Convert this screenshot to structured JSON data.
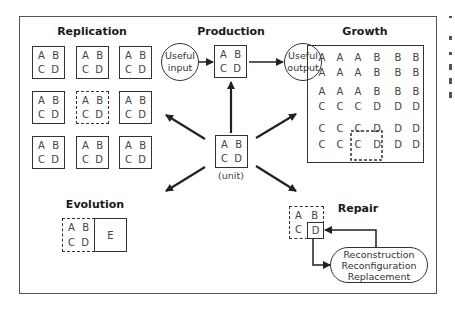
{
  "sections": {
    "replication": {
      "title": "Replication",
      "units": [
        {
          "a": "A",
          "b": "B",
          "c": "C",
          "d": "D",
          "style": "solid"
        },
        {
          "a": "A",
          "b": "B",
          "c": "C",
          "d": "D",
          "style": "solid"
        },
        {
          "a": "A",
          "b": "B",
          "c": "C",
          "d": "D",
          "style": "solid"
        },
        {
          "a": "A",
          "b": "B",
          "c": "C",
          "d": "D",
          "style": "solid"
        },
        {
          "a": "A",
          "b": "B",
          "c": "C",
          "d": "D",
          "style": "dashed"
        },
        {
          "a": "A",
          "b": "B",
          "c": "C",
          "d": "D",
          "style": "solid"
        },
        {
          "a": "A",
          "b": "B",
          "c": "C",
          "d": "D",
          "style": "solid"
        },
        {
          "a": "A",
          "b": "B",
          "c": "C",
          "d": "D",
          "style": "solid"
        },
        {
          "a": "A",
          "b": "B",
          "c": "C",
          "d": "D",
          "style": "solid"
        }
      ]
    },
    "production": {
      "title": "Production",
      "input_line1": "Useful",
      "input_line2": "input",
      "output_line1": "Useful",
      "output_line2": "output",
      "unit": {
        "a": "A",
        "b": "B",
        "c": "C",
        "d": "D"
      }
    },
    "growth": {
      "title": "Growth",
      "grid": [
        [
          "A",
          "A",
          "A",
          "B",
          "B",
          "B"
        ],
        [
          "A",
          "A",
          "A",
          "B",
          "B",
          "B"
        ],
        [
          "A",
          "A",
          "A",
          "B",
          "B",
          "B"
        ],
        [
          "C",
          "C",
          "C",
          "D",
          "D",
          "D"
        ],
        [
          "C",
          "C",
          "C",
          "D",
          "D",
          "D"
        ],
        [
          "C",
          "C",
          "C",
          "D",
          "D",
          "D"
        ]
      ]
    },
    "center": {
      "unit": {
        "a": "A",
        "b": "B",
        "c": "C",
        "d": "D"
      },
      "label": "(unit)"
    },
    "evolution": {
      "title": "Evolution",
      "unit": {
        "a": "A",
        "b": "B",
        "c": "C",
        "d": "D"
      },
      "new_part": "E"
    },
    "repair": {
      "title": "Repair",
      "unit": {
        "a": "A",
        "b": "B",
        "c": "C",
        "d": "D"
      },
      "methods": [
        "Reconstruction",
        "Reconfiguration",
        "Replacement"
      ]
    }
  },
  "colors": {
    "line": "#333333",
    "frame": "#555555",
    "text": "#444444",
    "background": "#ffffff"
  }
}
